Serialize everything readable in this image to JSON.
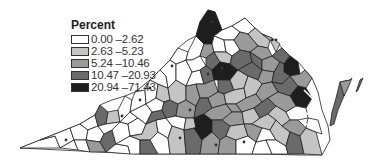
{
  "legend": {
    "title": "Percent",
    "classes": [
      {
        "label": "0.00 –2.62",
        "color": "#ffffff"
      },
      {
        "label": "2.63 –5.23",
        "color": "#c4c4c4"
      },
      {
        "label": "5.24 –10.46",
        "color": "#9a9a9a"
      },
      {
        "label": "10.47 –20.93",
        "color": "#6a6a6a"
      },
      {
        "label": "20.94 –71.43",
        "color": "#1e1e1e"
      }
    ]
  },
  "map": {
    "region": "Virginia counties",
    "fill_classes": [
      "#ffffff",
      "#c4c4c4",
      "#9a9a9a",
      "#6a6a6a",
      "#1e1e1e"
    ]
  }
}
